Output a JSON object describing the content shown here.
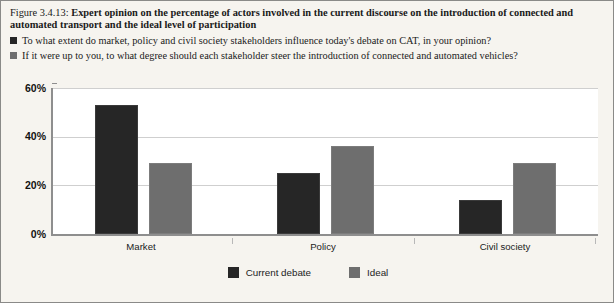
{
  "figure": {
    "number": "Figure 3.4.13:",
    "title": "Expert opinion on the percentage of actors involved in the current discourse on the introduction of connected and automated transport and the ideal level of participation"
  },
  "questions": [
    {
      "swatch_color": "#262626",
      "text": "To what extent do market, policy and civil society stakeholders influence today's debate on CAT, in your opinion?"
    },
    {
      "swatch_color": "#6e6e6e",
      "text": "If it were up to you, to what degree should each stakeholder steer the introduction of connected and automated vehicles?"
    }
  ],
  "chart_data": {
    "type": "bar",
    "title": "Expert opinion on the percentage of actors involved in the current discourse on the introduction of connected and automated transport and the ideal level of participation",
    "categories": [
      "Market",
      "Policy",
      "Civil society"
    ],
    "series": [
      {
        "name": "Current debate",
        "color": "#262626",
        "values": [
          53,
          25,
          14
        ]
      },
      {
        "name": "Ideal",
        "color": "#6e6e6e",
        "values": [
          29,
          36,
          29
        ]
      }
    ],
    "xlabel": "",
    "ylabel": "",
    "ylim": [
      0,
      60
    ],
    "ytick_labels": [
      "0%",
      "20%",
      "40%",
      "60%"
    ],
    "ytick_values": [
      0,
      20,
      40,
      60
    ],
    "grid": true,
    "legend_position": "bottom"
  },
  "colors": {
    "current_debate": "#262626",
    "ideal": "#6e6e6e",
    "panel_background": "#f6f4ef",
    "plot_background": "#ffffff",
    "gridline": "#cfcfcf",
    "axis": "#8e8e8e"
  }
}
